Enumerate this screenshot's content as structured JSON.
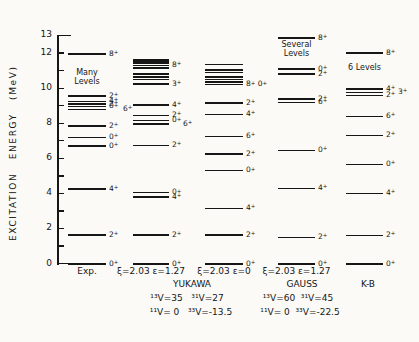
{
  "chart_data": {
    "type": "level-diagram",
    "title": "",
    "ylabel": "EXCITATION   ENERGY   (MeV)",
    "ylim": [
      0,
      13
    ],
    "yticks_minor_every": 1,
    "labeled_ticks": [
      [
        0,
        "0"
      ],
      [
        2,
        "2"
      ],
      [
        4,
        "4"
      ],
      [
        6,
        "6"
      ],
      [
        8,
        "8"
      ],
      [
        10,
        "10"
      ],
      [
        12,
        "12"
      ],
      [
        13,
        "13"
      ]
    ],
    "columns": [
      {
        "caption": "Exp.",
        "note": "Many Levels",
        "note_e": 10.6,
        "levels": [
          {
            "e": 0.0,
            "j": "0+"
          },
          {
            "e": 1.63,
            "j": "2+"
          },
          {
            "e": 4.25,
            "j": "4+"
          },
          {
            "e": 6.7,
            "j": "0+"
          },
          {
            "e": 7.2,
            "j": "0+"
          },
          {
            "e": 7.85,
            "j": "2+"
          },
          {
            "e": 8.8,
            "j": "6+",
            "dx": 14
          },
          {
            "e": 8.95,
            "j": "0+"
          },
          {
            "e": 9.1,
            "j": "2+"
          },
          {
            "e": 9.25,
            "j": "4+"
          },
          {
            "e": 9.55,
            "j": "2+"
          },
          {
            "e": 11.95,
            "j": "8+"
          }
        ]
      },
      {
        "caption": "ξ=2.03  ε=1.27",
        "note": "",
        "levels": [
          {
            "e": 0.0,
            "j": "0+"
          },
          {
            "e": 1.65,
            "j": "2+"
          },
          {
            "e": 3.8,
            "j": "4+"
          },
          {
            "e": 4.05,
            "j": "0+"
          },
          {
            "e": 6.75,
            "j": "2+"
          },
          {
            "e": 7.95,
            "j": "6+",
            "dx": 11
          },
          {
            "e": 8.15,
            "j": "0+"
          },
          {
            "e": 8.45,
            "j": "2+"
          },
          {
            "e": 9.05,
            "j": "4+"
          },
          {
            "e": 10.25,
            "j": "3+"
          },
          {
            "e": 10.5,
            "j": ""
          },
          {
            "e": 10.65,
            "j": ""
          },
          {
            "e": 10.8,
            "j": ""
          },
          {
            "e": 11.15,
            "j": ""
          },
          {
            "e": 11.3,
            "j": "8+"
          },
          {
            "e": 11.45,
            "j": ""
          },
          {
            "e": 11.55,
            "j": ""
          },
          {
            "e": 11.65,
            "j": ""
          }
        ]
      },
      {
        "caption": "ξ=2.03  ε=0",
        "note": "",
        "levels": [
          {
            "e": 0.0,
            "j": "0+"
          },
          {
            "e": 1.65,
            "j": "2+"
          },
          {
            "e": 3.15,
            "j": "4+"
          },
          {
            "e": 5.3,
            "j": "0+"
          },
          {
            "e": 6.25,
            "j": "2+"
          },
          {
            "e": 7.25,
            "j": "6+"
          },
          {
            "e": 8.5,
            "j": "4+"
          },
          {
            "e": 9.15,
            "j": "2+"
          },
          {
            "e": 10.2,
            "j": "8+ 0+"
          },
          {
            "e": 10.35,
            "j": ""
          },
          {
            "e": 10.5,
            "j": ""
          },
          {
            "e": 10.65,
            "j": ""
          },
          {
            "e": 10.9,
            "j": ""
          },
          {
            "e": 11.05,
            "j": ""
          },
          {
            "e": 11.35,
            "j": ""
          }
        ]
      },
      {
        "caption": "ξ=2.03  ε=1.27",
        "note": "Several Levels",
        "note_e": 12.2,
        "levels": [
          {
            "e": 0.0,
            "j": "0+"
          },
          {
            "e": 1.5,
            "j": "2+"
          },
          {
            "e": 4.3,
            "j": "4+"
          },
          {
            "e": 6.45,
            "j": "0+"
          },
          {
            "e": 9.2,
            "j": "6+"
          },
          {
            "e": 9.4,
            "j": "2+"
          },
          {
            "e": 10.8,
            "j": "2+"
          },
          {
            "e": 11.1,
            "j": "0+"
          },
          {
            "e": 12.85,
            "j": "8+"
          }
        ]
      },
      {
        "caption": "",
        "note": "6 Levels",
        "note_e": 10.9,
        "levels": [
          {
            "e": 0.0,
            "j": "0+"
          },
          {
            "e": 1.6,
            "j": "2+"
          },
          {
            "e": 4.0,
            "j": "4+"
          },
          {
            "e": 5.65,
            "j": "0+"
          },
          {
            "e": 7.3,
            "j": "2+"
          },
          {
            "e": 8.4,
            "j": "6+"
          },
          {
            "e": 9.6,
            "j": "2+"
          },
          {
            "e": 9.75,
            "j": "3+",
            "dx": 12
          },
          {
            "e": 9.95,
            "j": "4+"
          },
          {
            "e": 12.0,
            "j": "8+"
          }
        ]
      }
    ],
    "footer": {
      "yukawa": {
        "title": "YUKAWA",
        "line1": "¹³V=35   ³¹V=27",
        "line2": "¹¹V= 0   ³³V=-13.5"
      },
      "gauss": {
        "title": "GAUSS",
        "line1": "¹³V=60  ³¹V=45",
        "line2": "¹¹V= 0  ³³V=-22.5"
      },
      "kb": {
        "title": "K-B"
      }
    }
  }
}
